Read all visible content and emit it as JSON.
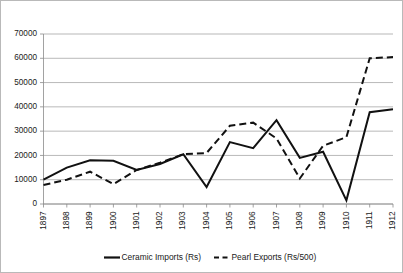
{
  "chart_data": {
    "type": "line",
    "title": "",
    "subtitle": "",
    "xlabel": "",
    "ylabel": "",
    "categories": [
      "1897",
      "1898",
      "1899",
      "1900",
      "1901",
      "1902",
      "1903",
      "1904",
      "1905",
      "1906",
      "1907",
      "1908",
      "1909",
      "1910",
      "1911",
      "1912"
    ],
    "x": [
      1897,
      1898,
      1899,
      1900,
      1901,
      1902,
      1903,
      1904,
      1905,
      1906,
      1907,
      1908,
      1909,
      1910,
      1911,
      1912
    ],
    "ylim": [
      0,
      70000
    ],
    "xlim": [
      1897,
      1912
    ],
    "yticks": [
      0,
      10000,
      20000,
      30000,
      40000,
      50000,
      60000,
      70000
    ],
    "ytick_labels": [
      "0",
      "10000",
      "20000",
      "30000",
      "40000",
      "50000",
      "60000",
      "70000"
    ],
    "xtick_labels": [
      "1897",
      "1898",
      "1899",
      "1900",
      "1901",
      "1902",
      "1903",
      "1904",
      "1905",
      "1906",
      "1907",
      "1908",
      "1909",
      "1910",
      "1911",
      "1912"
    ],
    "grid": true,
    "grid_axis": "y",
    "legend_position": "bottom",
    "series": [
      {
        "name": "Ceramic Imports (Rs)",
        "style": "solid",
        "color": "#111111",
        "values": [
          10000,
          15000,
          18000,
          17800,
          14000,
          16500,
          20500,
          7000,
          25500,
          23000,
          34500,
          19000,
          21500,
          1500,
          37800,
          39000
        ]
      },
      {
        "name": "Pearl Exports (Rs/500)",
        "style": "dashed",
        "color": "#111111",
        "values": [
          7800,
          10000,
          13300,
          8200,
          14000,
          17000,
          20500,
          21000,
          32200,
          33500,
          27000,
          10500,
          24000,
          27500,
          60000,
          60500
        ]
      }
    ]
  },
  "legend": {
    "items": [
      {
        "label": "Ceramic Imports (Rs)",
        "style": "solid"
      },
      {
        "label": "Pearl Exports (Rs/500)",
        "style": "dashed"
      }
    ]
  },
  "colors": {
    "series": "#111111",
    "gridline": "#9a9a9a",
    "axis": "#8a8a8a",
    "frame_border": "#b9b9b9",
    "background": "#ffffff",
    "text": "#1a1a1a"
  }
}
